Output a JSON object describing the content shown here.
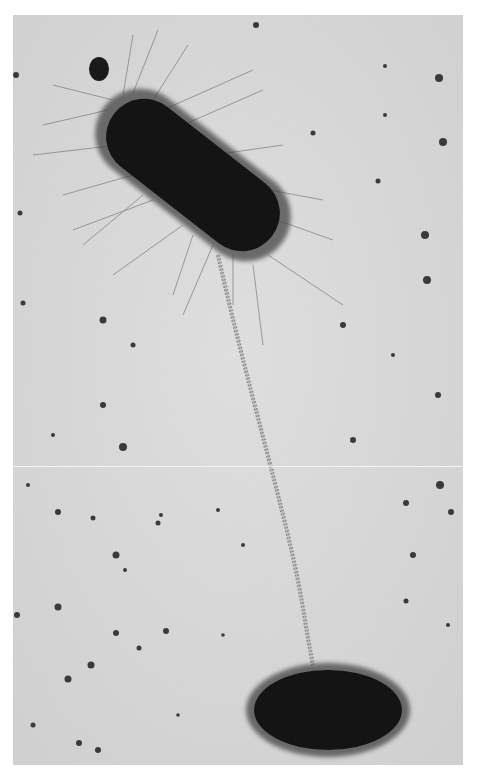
{
  "image": {
    "kind": "electron-micrograph",
    "subject": "bacterial conjugation",
    "colors": {
      "background": "#d9d9d9",
      "cell": "#151515",
      "pilus": "#8a8a8a",
      "speck": "#3a3a3a",
      "border": "#ffffff"
    },
    "objects": [
      {
        "name": "donor-cell",
        "shape": "rod with dense fimbriae",
        "position": "upper-left",
        "angle_deg": 38
      },
      {
        "name": "recipient-cell",
        "shape": "oval rod",
        "position": "lower-right"
      },
      {
        "name": "sex-pilus",
        "shape": "long beaded filament connecting cells"
      },
      {
        "name": "small-particle",
        "shape": "dark round body near donor cell tip"
      }
    ],
    "seam_y": 466
  }
}
